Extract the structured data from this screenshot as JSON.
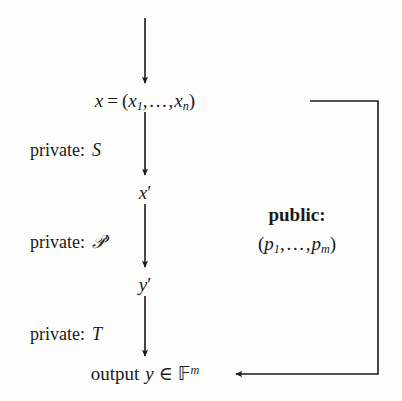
{
  "diagram": {
    "background_color": "#fdfdfc",
    "stroke_color": "#1a1a1a",
    "nodes": {
      "input_top": "x = (x1, ..., xn)",
      "intermediate_1": "x'",
      "intermediate_2": "y'",
      "output": "output y ∈ F^m"
    },
    "edge_labels": {
      "private_s": "private: S",
      "private_p": "private: P'",
      "private_t": "private: T"
    },
    "side_label": {
      "heading": "public:",
      "value": "(p1, ..., pm)"
    },
    "parts": {
      "x": "x",
      "equals": "=",
      "lparen": "(",
      "rparen": ")",
      "x_sub1": "1",
      "ellipsis": ",…,",
      "x_subn": "n",
      "prime": "′",
      "y": "y",
      "p": "p",
      "p_sub1": "1",
      "p_subm": "m",
      "private_word": "private:",
      "sym_s": "S",
      "sym_p": "𝒫",
      "sym_t": "T",
      "output_word": "output",
      "member": "∈",
      "field_f": "𝔽",
      "field_exp": "m",
      "public_word": "public:"
    }
  }
}
